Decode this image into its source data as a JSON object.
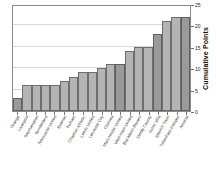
{
  "chart_data": {
    "type": "bar",
    "title": "",
    "xlabel": "",
    "ylabel": "Cumulative Points",
    "ylim": [
      0,
      25
    ],
    "yticks": [
      0,
      5,
      10,
      15,
      20,
      25
    ],
    "grid": true,
    "legend": "none",
    "categories": [
      "Orange",
      "Liverpool",
      "Southampton",
      "Sunderland",
      "Newcastle United",
      "Everton",
      "Fulham",
      "Charlton Athletic",
      "Leeds United",
      "Leicester City",
      "Chelsea",
      "Manchester United",
      "West Ham United",
      "Blackburn Rovers",
      "Derby County",
      "Aston Villa",
      "Ipswich Town",
      "Tottenham Hotspur",
      "Arsenal"
    ],
    "values": [
      3,
      6,
      6,
      6,
      6,
      7,
      8,
      9,
      9,
      10,
      11,
      11,
      14,
      15,
      15,
      18,
      21,
      22,
      22
    ],
    "highlighted_indices": [
      0,
      11,
      15,
      18
    ]
  },
  "axis": {
    "y_title": "Cumulative Points",
    "y_tick_labels": [
      "0",
      "5",
      "10",
      "15",
      "20",
      "25"
    ]
  },
  "colors": {
    "bar_fill": "#b4b4b4",
    "bar_fill_dark": "#9a9a9a",
    "bar_stroke": "#6e6e6e",
    "grid": "#d9d9d9",
    "frame": "#8a8a8a",
    "background": "#ffffff",
    "text": "#3a3a3a"
  }
}
